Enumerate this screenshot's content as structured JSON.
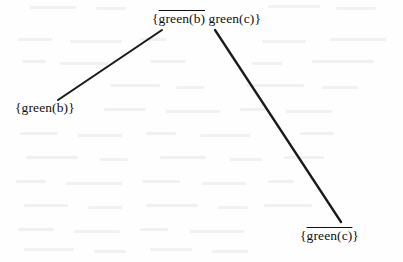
{
  "figure": {
    "kind": "tree-diagram",
    "background_color": "#fefefe",
    "edge_color": "#1a1a1a",
    "text_color": "#101010"
  },
  "nodes": {
    "root": {
      "name": "root-node",
      "open_brace": "{",
      "term_overlined": "green(b)",
      "separator": " ",
      "term_plain": "green(c)",
      "close_brace": "}",
      "x": 152,
      "y": 12
    },
    "left_child": {
      "name": "left-child-node",
      "open_brace": "{",
      "term_plain": "green(b)",
      "close_brace": "}",
      "x": 15,
      "y": 101
    },
    "right_child": {
      "name": "right-child-node",
      "open_brace": "{",
      "term_overlined": "green(c)",
      "close_brace": "}",
      "x": 300,
      "y": 229
    }
  },
  "edges": [
    {
      "name": "edge-root-to-left-child",
      "from": "root",
      "to": "left_child",
      "x1": 162,
      "y1": 30,
      "x2": 58,
      "y2": 100,
      "width": 2.1
    },
    {
      "name": "edge-root-to-right-child",
      "from": "root",
      "to": "right_child",
      "x1": 215,
      "y1": 30,
      "x2": 341,
      "y2": 222,
      "width": 2.3
    }
  ]
}
